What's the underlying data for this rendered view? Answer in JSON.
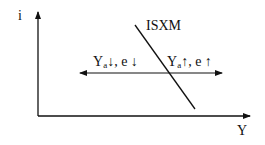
{
  "axes": {
    "y_label": "i",
    "x_label": "Y"
  },
  "curve": {
    "label": "ISXM"
  },
  "annotations": {
    "left": {
      "var": "Y",
      "sub": "a",
      "rest": "↓, e ↓"
    },
    "right": {
      "var": "Y",
      "sub": "a",
      "rest": "↑, e ↑"
    }
  },
  "colors": {
    "line": "#111111",
    "background": "#ffffff"
  }
}
